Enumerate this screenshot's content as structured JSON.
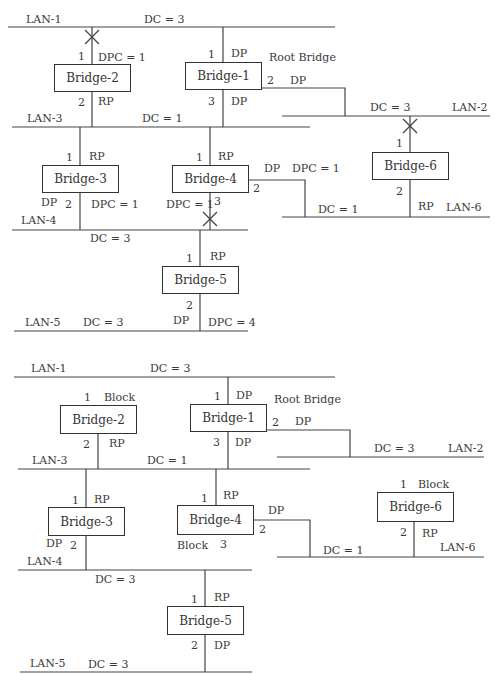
{
  "top_diagram": {
    "lans": {
      "lan1": {
        "name": "LAN-1",
        "dc": "DC = 3"
      },
      "lan2": {
        "name": "LAN-2",
        "dc": "DC = 3"
      },
      "lan3": {
        "name": "LAN-3",
        "dc": "DC = 1"
      },
      "lan4": {
        "name": "LAN-4",
        "dc": "DC = 3"
      },
      "lan5": {
        "name": "LAN-5",
        "dc": "DC = 3"
      },
      "lan6": {
        "name": "LAN-6",
        "dc": "DC = 1"
      }
    },
    "bridges": {
      "b1": {
        "name": "Bridge-1",
        "note": "Root Bridge",
        "p1": "1",
        "p1_role": "DP",
        "p2": "2",
        "p2_role": "DP",
        "p3": "3",
        "p3_role": "DP"
      },
      "b2": {
        "name": "Bridge-2",
        "p1": "1",
        "p1_role": "DPC = 1",
        "p2": "2",
        "p2_role": "RP"
      },
      "b3": {
        "name": "Bridge-3",
        "p1": "1",
        "p1_role": "RP",
        "p2": "2",
        "p2_role_left": "DP",
        "p2_role_right": "DPC = 1"
      },
      "b4": {
        "name": "Bridge-4",
        "p1": "1",
        "p1_role": "RP",
        "p2": "2",
        "p2_role": "DP",
        "p2_dpc": "DPC = 1",
        "p3": "3",
        "p3_role": "DPC = 1"
      },
      "b5": {
        "name": "Bridge-5",
        "p1": "1",
        "p1_role": "RP",
        "p2": "2",
        "p2_role_left": "DP",
        "p2_role_right": "DPC = 4"
      },
      "b6": {
        "name": "Bridge-6",
        "p1": "1",
        "p2": "2",
        "p2_role": "RP"
      }
    }
  },
  "bottom_diagram": {
    "lans": {
      "lan1": {
        "name": "LAN-1",
        "dc": "DC = 3"
      },
      "lan2": {
        "name": "LAN-2",
        "dc": "DC = 3"
      },
      "lan3": {
        "name": "LAN-3",
        "dc": "DC = 1"
      },
      "lan4": {
        "name": "LAN-4",
        "dc": "DC = 3"
      },
      "lan5": {
        "name": "LAN-5",
        "dc": "DC = 3"
      },
      "lan6": {
        "name": "LAN-6",
        "dc": "DC = 1"
      }
    },
    "bridges": {
      "b1": {
        "name": "Bridge-1",
        "note": "Root Bridge",
        "p1": "1",
        "p1_role": "DP",
        "p2": "2",
        "p2_role": "DP",
        "p3": "3",
        "p3_role": "DP"
      },
      "b2": {
        "name": "Bridge-2",
        "p1": "1",
        "p1_role": "Block",
        "p2": "2",
        "p2_role": "RP"
      },
      "b3": {
        "name": "Bridge-3",
        "p1": "1",
        "p1_role": "RP",
        "p2": "2",
        "p2_role": "DP"
      },
      "b4": {
        "name": "Bridge-4",
        "p1": "1",
        "p1_role": "RP",
        "p2": "2",
        "p2_role": "DP",
        "p3": "3",
        "p3_role": "Block"
      },
      "b5": {
        "name": "Bridge-5",
        "p1": "1",
        "p1_role": "RP",
        "p2": "2",
        "p2_role": "DP"
      },
      "b6": {
        "name": "Bridge-6",
        "p1": "1",
        "p1_role": "Block",
        "p2": "2",
        "p2_role": "RP"
      }
    }
  }
}
